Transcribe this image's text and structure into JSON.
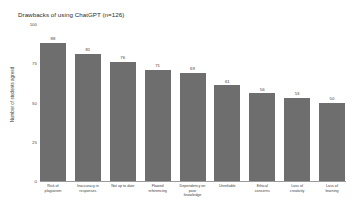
{
  "chart_data": {
    "type": "bar",
    "title": "Drawbacks of using ChatGPT (n=126)",
    "xlabel": "",
    "ylabel": "Number of students agreed",
    "ylim": [
      0,
      100
    ],
    "yticks": [
      0,
      25,
      50,
      75,
      100
    ],
    "ytick_labels": [
      "0",
      "25",
      "50",
      "75",
      "100"
    ],
    "grid": false,
    "legend": false,
    "bar_color": "#6e6e6e",
    "categories": [
      "Risk of plagiarism",
      "Inaccuracy in responses",
      "Not up to date",
      "Flawed referencing",
      "Dependency on poor knowledge",
      "Unreliable",
      "Ethical concerns",
      "Loss of creativity",
      "Loss of learning"
    ],
    "values": [
      88,
      81,
      76,
      71,
      69,
      61,
      56,
      53,
      50
    ],
    "value_labels": [
      "88",
      "81",
      "76",
      "71",
      "69",
      "61",
      "56",
      "53",
      "50"
    ]
  },
  "caption": ""
}
